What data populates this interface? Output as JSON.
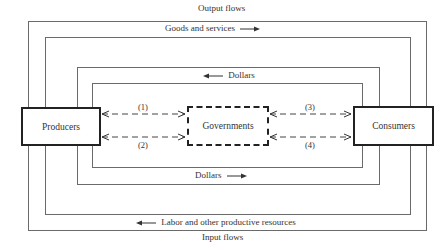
{
  "diagram": {
    "top_caption": "Output flows",
    "bottom_caption": "Input flows",
    "outer_flows": {
      "goods_label": "Goods and services",
      "goods_direction": "right",
      "labor_label": "Labor and other productive resources",
      "labor_direction": "left"
    },
    "inner_flows": {
      "top_dollars_label": "Dollars",
      "top_dollars_direction": "left",
      "bottom_dollars_label": "Dollars",
      "bottom_dollars_direction": "right"
    },
    "nodes": {
      "producers": "Producers",
      "governments": "Governments",
      "consumers": "Consumers"
    },
    "government_links": [
      {
        "id": "1",
        "label": "(1)",
        "between": "producers-governments",
        "position": "upper"
      },
      {
        "id": "2",
        "label": "(2)",
        "between": "producers-governments",
        "position": "lower"
      },
      {
        "id": "3",
        "label": "(3)",
        "between": "governments-consumers",
        "position": "upper"
      },
      {
        "id": "4",
        "label": "(4)",
        "between": "governments-consumers",
        "position": "lower"
      }
    ],
    "colors": {
      "line": "#6a6a6a",
      "box_border": "#222222",
      "text": "#333333"
    }
  }
}
